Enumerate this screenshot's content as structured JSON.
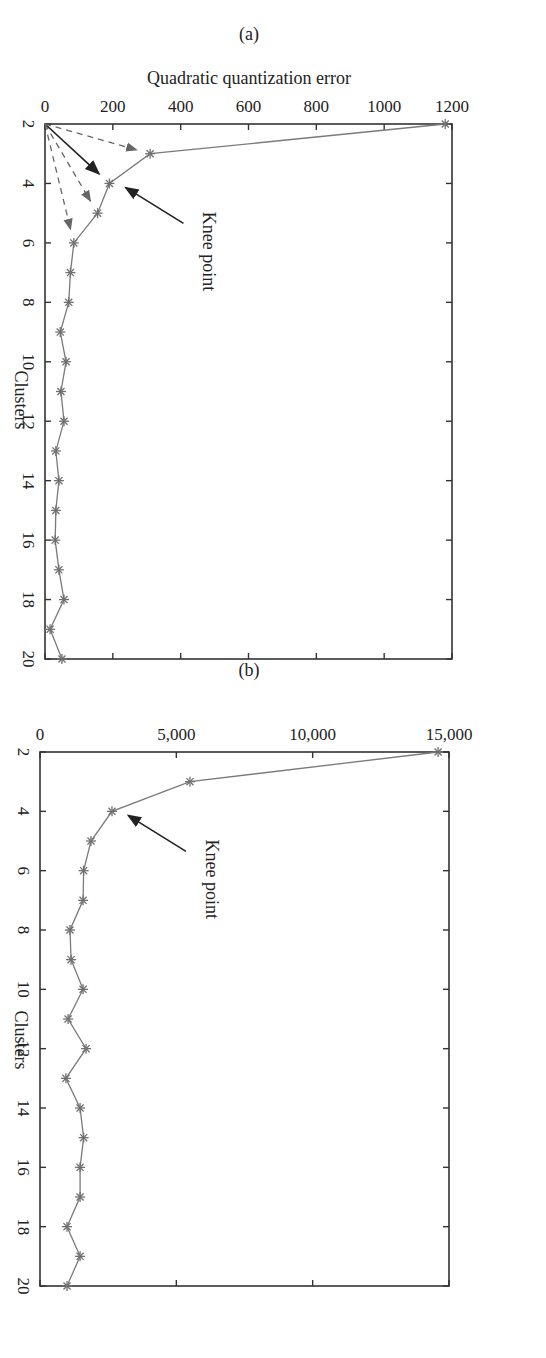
{
  "figure": {
    "rotation_deg": 90,
    "panels": [
      "(a)",
      "(b)"
    ]
  },
  "colors": {
    "series": "#7a7a7a",
    "axis": "#333333",
    "arrow_solid": "#222222",
    "arrow_dashed": "#666666"
  },
  "chart_data": [
    {
      "type": "line",
      "panel_label": "(a)",
      "title": "",
      "xlabel": "Clusters",
      "ylabel": "Quadratic quantization error",
      "x": [
        2,
        3,
        4,
        5,
        6,
        7,
        8,
        9,
        10,
        11,
        12,
        13,
        14,
        15,
        16,
        17,
        18,
        19,
        20
      ],
      "series": [
        {
          "name": "Quadratic quantization error",
          "marker": "asterisk",
          "values": [
            1180,
            310,
            190,
            155,
            85,
            75,
            70,
            45,
            62,
            47,
            56,
            32,
            41,
            32,
            30,
            41,
            56,
            15,
            50
          ]
        }
      ],
      "xlim": [
        2,
        20
      ],
      "ylim": [
        0,
        1200
      ],
      "xticks": [
        2,
        4,
        6,
        8,
        10,
        12,
        14,
        16,
        18,
        20
      ],
      "yticks": [
        0,
        200,
        400,
        600,
        800,
        1000,
        1200
      ],
      "ytick_labels": [
        "0",
        "200",
        "400",
        "600",
        "800",
        "1000",
        "1200"
      ],
      "grid": false,
      "annotations": [
        {
          "text": "Knee point",
          "points_to": {
            "x": 4,
            "y": 190
          },
          "style": "solid-arrow"
        },
        {
          "text": "",
          "from": {
            "x": 2,
            "y": 0
          },
          "to": {
            "x": 4,
            "y": 190
          },
          "style": "solid-arrow"
        },
        {
          "text": "",
          "from": {
            "x": 2,
            "y": 0
          },
          "to": {
            "x": 3,
            "y": 310
          },
          "style": "dashed-arrow"
        },
        {
          "text": "",
          "from": {
            "x": 2,
            "y": 0
          },
          "to": {
            "x": 5,
            "y": 155
          },
          "style": "dashed-arrow"
        },
        {
          "text": "",
          "from": {
            "x": 2,
            "y": 0
          },
          "to": {
            "x": 6,
            "y": 85
          },
          "style": "dashed-arrow"
        }
      ]
    },
    {
      "type": "line",
      "panel_label": "(b)",
      "title": "",
      "xlabel": "Clusters",
      "ylabel": "",
      "x": [
        2,
        3,
        4,
        5,
        6,
        7,
        8,
        9,
        10,
        11,
        12,
        13,
        14,
        15,
        16,
        17,
        18,
        19,
        20
      ],
      "series": [
        {
          "name": "Quadratic quantization error",
          "marker": "asterisk",
          "values": [
            14600,
            5500,
            2640,
            1870,
            1600,
            1580,
            1100,
            1140,
            1580,
            1030,
            1690,
            950,
            1470,
            1600,
            1470,
            1470,
            990,
            1470,
            990
          ]
        }
      ],
      "xlim": [
        2,
        20
      ],
      "ylim": [
        0,
        15000
      ],
      "xticks": [
        2,
        4,
        6,
        8,
        10,
        12,
        14,
        16,
        18,
        20
      ],
      "yticks": [
        0,
        5000,
        10000,
        15000
      ],
      "ytick_labels": [
        "0",
        "5,000",
        "10,000",
        "15,000"
      ],
      "grid": false,
      "annotations": [
        {
          "text": "Knee point",
          "points_to": {
            "x": 4,
            "y": 2640
          },
          "style": "solid-arrow"
        }
      ]
    }
  ]
}
